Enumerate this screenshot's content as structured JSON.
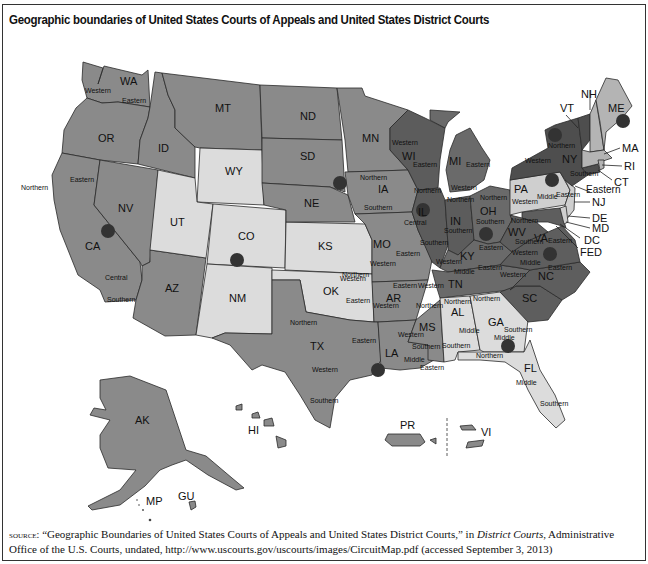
{
  "title": "Geographic boundaries of United States Courts of Appeals and United States District Courts",
  "colors": {
    "dark": "#6a6a6a",
    "medium": "#8d8d8d",
    "light": "#dadada",
    "darkest": "#5a5a5a",
    "circle": "#333333",
    "background": "#ffffff"
  },
  "states": [
    {
      "abbr": "WA",
      "districts": [
        "Western",
        "Eastern"
      ]
    },
    {
      "abbr": "OR",
      "districts": []
    },
    {
      "abbr": "ID",
      "districts": []
    },
    {
      "abbr": "MT",
      "districts": []
    },
    {
      "abbr": "WY",
      "districts": []
    },
    {
      "abbr": "CA",
      "districts": [
        "Northern",
        "Eastern",
        "Central",
        "Southern"
      ]
    },
    {
      "abbr": "NV",
      "districts": []
    },
    {
      "abbr": "UT",
      "districts": []
    },
    {
      "abbr": "CO",
      "districts": []
    },
    {
      "abbr": "AZ",
      "districts": []
    },
    {
      "abbr": "NM",
      "districts": []
    },
    {
      "abbr": "ND",
      "districts": []
    },
    {
      "abbr": "SD",
      "districts": []
    },
    {
      "abbr": "NE",
      "districts": []
    },
    {
      "abbr": "KS",
      "districts": []
    },
    {
      "abbr": "OK",
      "districts": [
        "Western",
        "Northern",
        "Eastern"
      ]
    },
    {
      "abbr": "TX",
      "districts": [
        "Northern",
        "Eastern",
        "Western",
        "Southern"
      ]
    },
    {
      "abbr": "MN",
      "districts": []
    },
    {
      "abbr": "IA",
      "districts": [
        "Northern",
        "Southern"
      ]
    },
    {
      "abbr": "MO",
      "districts": [
        "Western",
        "Eastern"
      ]
    },
    {
      "abbr": "AR",
      "districts": [
        "Western",
        "Eastern"
      ]
    },
    {
      "abbr": "LA",
      "districts": [
        "Western",
        "Middle",
        "Eastern"
      ]
    },
    {
      "abbr": "WI",
      "districts": [
        "Western",
        "Eastern"
      ]
    },
    {
      "abbr": "IL",
      "districts": [
        "Northern",
        "Central",
        "Southern"
      ]
    },
    {
      "abbr": "MI",
      "districts": [
        "Western",
        "Eastern"
      ]
    },
    {
      "abbr": "IN",
      "districts": [
        "Northern",
        "Southern"
      ]
    },
    {
      "abbr": "OH",
      "districts": [
        "Northern",
        "Southern"
      ]
    },
    {
      "abbr": "KY",
      "districts": [
        "Western",
        "Eastern"
      ]
    },
    {
      "abbr": "TN",
      "districts": [
        "Western",
        "Middle",
        "Eastern"
      ]
    },
    {
      "abbr": "MS",
      "districts": [
        "Northern",
        "Southern"
      ]
    },
    {
      "abbr": "AL",
      "districts": [
        "Northern",
        "Middle",
        "Southern"
      ]
    },
    {
      "abbr": "GA",
      "districts": [
        "Northern",
        "Middle",
        "Southern"
      ]
    },
    {
      "abbr": "FL",
      "districts": [
        "Northern",
        "Middle",
        "Southern"
      ]
    },
    {
      "abbr": "SC",
      "districts": []
    },
    {
      "abbr": "NC",
      "districts": [
        "Western",
        "Middle",
        "Eastern"
      ]
    },
    {
      "abbr": "VA",
      "districts": [
        "Western",
        "Eastern"
      ]
    },
    {
      "abbr": "WV",
      "districts": [
        "Northern",
        "Southern"
      ]
    },
    {
      "abbr": "PA",
      "districts": [
        "Western",
        "Middle",
        "Eastern"
      ]
    },
    {
      "abbr": "NY",
      "districts": [
        "Western",
        "Northern",
        "Eastern",
        "Southern"
      ]
    },
    {
      "abbr": "VT",
      "districts": []
    },
    {
      "abbr": "NH",
      "districts": []
    },
    {
      "abbr": "ME",
      "districts": []
    },
    {
      "abbr": "MA",
      "districts": []
    },
    {
      "abbr": "RI",
      "districts": []
    },
    {
      "abbr": "CT",
      "districts": []
    },
    {
      "abbr": "NJ",
      "districts": []
    },
    {
      "abbr": "DE",
      "districts": []
    },
    {
      "abbr": "MD",
      "districts": []
    },
    {
      "abbr": "DC",
      "districts": []
    },
    {
      "abbr": "FED",
      "districts": []
    },
    {
      "abbr": "AK",
      "districts": []
    },
    {
      "abbr": "HI",
      "districts": []
    },
    {
      "abbr": "PR",
      "districts": []
    },
    {
      "abbr": "VI",
      "districts": []
    },
    {
      "abbr": "MP",
      "districts": []
    },
    {
      "abbr": "GU",
      "districts": []
    }
  ],
  "labels": {
    "WA": "WA",
    "OR": "OR",
    "ID": "ID",
    "MT": "MT",
    "WY": "WY",
    "CA": "CA",
    "NV": "NV",
    "UT": "UT",
    "CO": "CO",
    "AZ": "AZ",
    "NM": "NM",
    "ND": "ND",
    "SD": "SD",
    "NE": "NE",
    "KS": "KS",
    "OK": "OK",
    "TX": "TX",
    "MN": "MN",
    "IA": "IA",
    "MO": "MO",
    "AR": "AR",
    "LA": "LA",
    "WI": "WI",
    "IL": "IL",
    "MI": "MI",
    "IN": "IN",
    "OH": "OH",
    "KY": "KY",
    "TN": "TN",
    "MS": "MS",
    "AL": "AL",
    "GA": "GA",
    "FL": "FL",
    "SC": "SC",
    "NC": "NC",
    "VA": "VA",
    "WV": "WV",
    "PA": "PA",
    "NY": "NY",
    "VT": "VT",
    "NH": "NH",
    "ME": "ME",
    "MA": "MA",
    "RI": "RI",
    "CT": "CT",
    "NJ": "NJ",
    "DE": "DE",
    "MD": "MD",
    "DC": "DC",
    "FED": "FED",
    "AK": "AK",
    "HI": "HI",
    "PR": "PR",
    "VI": "VI",
    "MP": "MP",
    "GU": "GU"
  },
  "district_words": {
    "western": "Western",
    "eastern": "Eastern",
    "northern": "Northern",
    "southern": "Southern",
    "middle": "Middle",
    "central": "Central"
  },
  "circuit_markers": [
    {
      "circuit": "1",
      "near": "ME"
    },
    {
      "circuit": "2",
      "near": "NY"
    },
    {
      "circuit": "3",
      "near": "PA"
    },
    {
      "circuit": "4",
      "near": "VA"
    },
    {
      "circuit": "5",
      "near": "LA"
    },
    {
      "circuit": "6",
      "near": "OH"
    },
    {
      "circuit": "7",
      "near": "IN"
    },
    {
      "circuit": "8",
      "near": "NE"
    },
    {
      "circuit": "9",
      "near": "CA"
    },
    {
      "circuit": "10",
      "near": "CO"
    },
    {
      "circuit": "11",
      "near": "GA"
    },
    {
      "circuit": "DC",
      "near": "DC"
    }
  ],
  "source": {
    "prefix": "source:",
    "quote": "“Geographic Boundaries of United States Courts of Appeals and United States District Courts,” in ",
    "publication": "District Courts",
    "rest": ", Administrative Office of the U.S. Courts, undated, http://www.uscourts.gov/uscourts/images/CircuitMap.pdf (accessed September 3, 2013)"
  }
}
